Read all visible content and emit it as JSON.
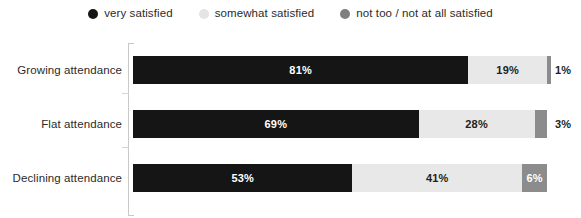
{
  "chart_data": {
    "type": "bar",
    "orientation": "horizontal",
    "stacked": true,
    "stack_total": 100,
    "unit": "%",
    "title": "",
    "subtitle": "",
    "xlabel": "",
    "ylabel": "",
    "xlim": [
      0,
      100
    ],
    "grid": false,
    "legend_position": "top-center",
    "categories": [
      "Growing attendance",
      "Flat attendance",
      "Declining attendance"
    ],
    "series": [
      {
        "name": "very satisfied",
        "color": "#151515",
        "values": [
          81,
          69,
          53
        ],
        "labels": [
          "81%",
          "69%",
          "53%"
        ]
      },
      {
        "name": "somewhat satisfied",
        "color": "#e8e8e8",
        "values": [
          19,
          28,
          41
        ],
        "labels": [
          "19%",
          "28%",
          "41%"
        ]
      },
      {
        "name": "not too / not at all satisfied",
        "color": "#8c8c8c",
        "values": [
          1,
          3,
          6
        ],
        "labels": [
          "1%",
          "3%",
          "6%"
        ]
      }
    ],
    "rows": [
      {
        "category": "Growing attendance",
        "segments": [
          {
            "series": "very satisfied",
            "value": 81,
            "label": "81%",
            "label_inside": true,
            "label_color": "on-dark"
          },
          {
            "series": "somewhat satisfied",
            "value": 19,
            "label": "19%",
            "label_inside": true,
            "label_color": "on-light"
          },
          {
            "series": "not too / not at all satisfied",
            "value": 1,
            "label": "1%",
            "label_inside": false,
            "label_color": "on-light"
          }
        ]
      },
      {
        "category": "Flat attendance",
        "segments": [
          {
            "series": "very satisfied",
            "value": 69,
            "label": "69%",
            "label_inside": true,
            "label_color": "on-dark"
          },
          {
            "series": "somewhat satisfied",
            "value": 28,
            "label": "28%",
            "label_inside": true,
            "label_color": "on-light"
          },
          {
            "series": "not too / not at all satisfied",
            "value": 3,
            "label": "3%",
            "label_inside": false,
            "label_color": "on-light"
          }
        ]
      },
      {
        "category": "Declining attendance",
        "segments": [
          {
            "series": "very satisfied",
            "value": 53,
            "label": "53%",
            "label_inside": true,
            "label_color": "on-dark"
          },
          {
            "series": "somewhat satisfied",
            "value": 41,
            "label": "41%",
            "label_inside": true,
            "label_color": "on-light"
          },
          {
            "series": "not too / not at all satisfied",
            "value": 6,
            "label": "6%",
            "label_inside": true,
            "label_color": "on-mid"
          }
        ]
      }
    ]
  },
  "legend": {
    "items": [
      {
        "label": "very satisfied",
        "color": "#151515"
      },
      {
        "label": "somewhat satisfied",
        "color": "#e4e4e4"
      },
      {
        "label": "not too / not at all satisfied",
        "color": "#7f7f7f"
      }
    ]
  },
  "layout": {
    "plot_left": 133,
    "plot_width": 414,
    "row_height": 28,
    "row_tops": [
      18,
      72,
      126
    ],
    "tick_tops": [
      55,
      109
    ],
    "outside_label_gap": 8
  },
  "colors": {
    "background": "#ffffff",
    "axis": "#c9c9c9",
    "tick": "#d6d6d6",
    "text": "#231f20"
  }
}
